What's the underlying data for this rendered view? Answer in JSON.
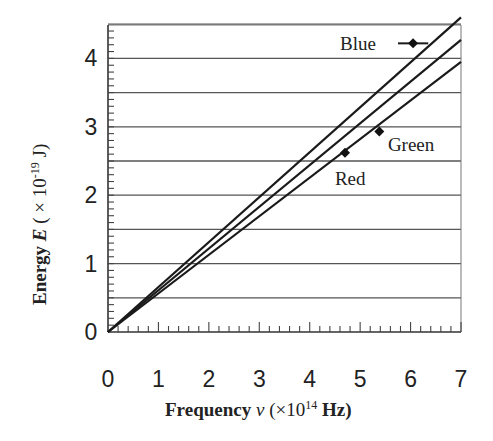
{
  "chart_data": {
    "type": "line",
    "title": "",
    "xlabel": "Frequency ν (×10^14 Hz)",
    "ylabel": "Energy E (×10^-19 J)",
    "xlabel_parts": {
      "main": "Frequency",
      "symbol": "ν",
      "unit_pre": "(×10",
      "unit_exp": "14",
      "unit_post": " Hz)"
    },
    "ylabel_parts": {
      "main": "Energy",
      "symbol": "E",
      "unit_pre": "( × 10",
      "unit_exp": "-19",
      "unit_post": "  J)"
    },
    "xlim": [
      0,
      7
    ],
    "ylim": [
      0,
      4.5
    ],
    "x_ticks": [
      0,
      1,
      2,
      3,
      4,
      5,
      6,
      7
    ],
    "y_ticks": [
      0,
      1,
      2,
      3,
      4
    ],
    "grid": {
      "horizontal_every": 0.5,
      "vertical": false
    },
    "x_minor_ticks_per_unit": 5,
    "y_minor_ticks_per_half_unit": 5,
    "lines": [
      {
        "name": "Line 1",
        "slope": 0.657,
        "x": [
          0,
          7
        ],
        "y": [
          0,
          4.6
        ]
      },
      {
        "name": "Line 2",
        "slope": 0.61,
        "x": [
          0,
          7
        ],
        "y": [
          0,
          4.27
        ]
      },
      {
        "name": "Line 3",
        "slope": 0.564,
        "x": [
          0,
          7
        ],
        "y": [
          0,
          3.95
        ]
      }
    ],
    "points": [
      {
        "label": "Blue",
        "x": 6.05,
        "y": 4.22,
        "x_err": [
          5.75,
          6.35
        ]
      },
      {
        "label": "Green",
        "x": 5.38,
        "y": 2.93,
        "x_err": null
      },
      {
        "label": "Red",
        "x": 4.7,
        "y": 2.62,
        "x_err": null
      }
    ],
    "annotations": [
      {
        "text": "Blue",
        "x": 4.6,
        "y": 4.22
      },
      {
        "text": "Green",
        "x": 5.55,
        "y": 2.75
      },
      {
        "text": "Red",
        "x": 4.5,
        "y": 2.25
      }
    ],
    "legend": null
  }
}
